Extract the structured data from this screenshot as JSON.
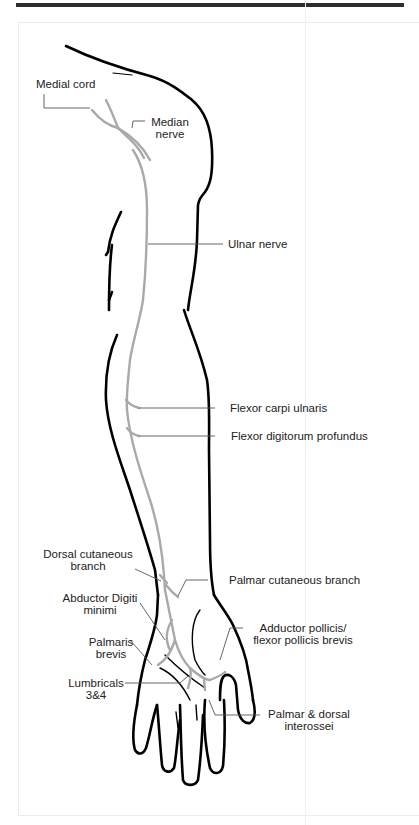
{
  "figure": {
    "colors": {
      "outline": "#000000",
      "nerve": "#a9a9a9",
      "leader": "#555555",
      "text": "#222222",
      "top_rule": "#2e2e2e"
    },
    "labels": {
      "medial_cord": "Medial cord",
      "median_nerve_1": "Median",
      "median_nerve_2": "nerve",
      "ulnar_nerve": "Ulnar nerve",
      "flexor_carpi_ulnaris": "Flexor carpi ulnaris",
      "flexor_digitorum_profundus": "Flexor digitorum profundus",
      "dorsal_cutaneous_1": "Dorsal cutaneous",
      "dorsal_cutaneous_2": "branch",
      "palmar_cutaneous": "Palmar cutaneous branch",
      "abductor_digiti_1": "Abductor Digiti",
      "abductor_digiti_2": "minimi",
      "adductor_pollicis_1": "Adductor pollicis/",
      "adductor_pollicis_2": "flexor pollicis brevis",
      "palmaris_brevis_1": "Palmaris",
      "palmaris_brevis_2": "brevis",
      "lumbricals_1": "Lumbricals",
      "lumbricals_2": "3&4",
      "interossei_1": "Palmar & dorsal",
      "interossei_2": "interossei"
    }
  }
}
